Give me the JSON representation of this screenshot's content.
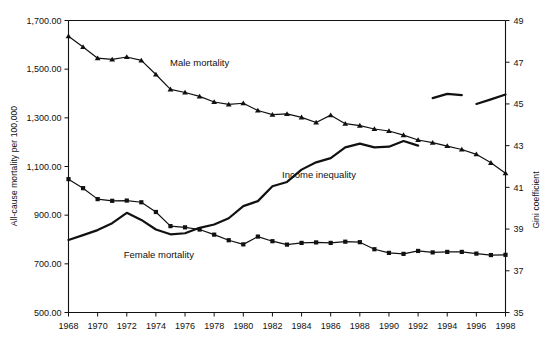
{
  "chart_data": {
    "type": "line",
    "title": "",
    "xlabel": "",
    "ylabel": "All-cause mortality per 100,000",
    "y2label": "Gini coefficient",
    "grid": false,
    "legend": "inline-annotations",
    "xlim": [
      1968,
      1998
    ],
    "ylim": [
      500,
      1700
    ],
    "y2lim": [
      35,
      49
    ],
    "x": [
      1968,
      1969,
      1970,
      1971,
      1972,
      1973,
      1974,
      1975,
      1976,
      1977,
      1978,
      1979,
      1980,
      1981,
      1982,
      1983,
      1984,
      1985,
      1986,
      1987,
      1988,
      1989,
      1990,
      1991,
      1992,
      1993,
      1994,
      1995,
      1996,
      1997,
      1998
    ],
    "xticks": [
      1968,
      1970,
      1972,
      1974,
      1976,
      1978,
      1980,
      1982,
      1984,
      1986,
      1988,
      1990,
      1992,
      1994,
      1996,
      1998
    ],
    "xtick_labels": [
      "1968",
      "1970",
      "1972",
      "1974",
      "1976",
      "1978",
      "1980",
      "1982",
      "1984",
      "1986",
      "1988",
      "1990",
      "1992",
      "1994",
      "1996",
      "1998"
    ],
    "yticks": [
      500,
      700,
      900,
      1100,
      1300,
      1500,
      1700
    ],
    "ytick_labels": [
      "500.00",
      "700.00",
      "900.00",
      "1,100.00",
      "1,300.00",
      "1,500.00",
      "1,700.00"
    ],
    "y2ticks": [
      35,
      37,
      39,
      41,
      43,
      45,
      47,
      49
    ],
    "y2tick_labels": [
      "35",
      "37",
      "39",
      "41",
      "43",
      "45",
      "47",
      "49"
    ],
    "series": [
      {
        "name": "Male mortality",
        "axis": "left",
        "marker": "triangle",
        "label_x": 1977.0,
        "label_y": 1512,
        "values": [
          1635,
          1591,
          1545,
          1540,
          1550,
          1536,
          1478,
          1417,
          1404,
          1388,
          1365,
          1355,
          1360,
          1330,
          1313,
          1316,
          1302,
          1281,
          1311,
          1276,
          1268,
          1254,
          1246,
          1229,
          1209,
          1198,
          1184,
          1170,
          1150,
          1115,
          1072
        ]
      },
      {
        "name": "Female mortality",
        "axis": "left",
        "marker": "square",
        "label_x": 1974.2,
        "label_y": 726,
        "values": [
          1048,
          1011,
          966,
          959,
          960,
          953,
          913,
          855,
          850,
          841,
          820,
          797,
          780,
          812,
          793,
          779,
          786,
          788,
          786,
          791,
          789,
          760,
          745,
          741,
          753,
          747,
          749,
          749,
          742,
          736,
          737
        ]
      },
      {
        "name": "Income inequality",
        "axis": "right",
        "marker": "none",
        "label_x": 1985.2,
        "label_y_right": 41.45,
        "values_right": [
          38.48,
          38.71,
          38.95,
          39.28,
          39.78,
          39.44,
          38.98,
          38.75,
          38.8,
          39.06,
          39.22,
          39.52,
          40.1,
          40.34,
          41.05,
          41.26,
          41.85,
          42.2,
          42.4,
          42.92,
          43.1,
          42.92,
          42.95,
          43.22,
          43.0,
          45.28,
          45.48,
          45.42,
          45.0,
          45.22,
          45.45
        ],
        "break_after": [
          1992,
          1995
        ],
        "note": "series is drawn in three disconnected segments: 1968-1992, 1993-1995, 1996-1998"
      }
    ]
  }
}
